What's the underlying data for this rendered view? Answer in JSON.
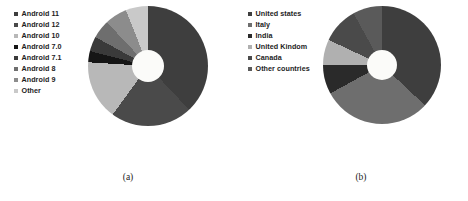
{
  "figure": {
    "panels": [
      {
        "caption": "(a)",
        "legend_position": "left",
        "chart": {
          "type": "pie",
          "subtype": "donut",
          "title": "",
          "xlabel": "",
          "ylabel": "",
          "legend_position": "left",
          "grid": false,
          "hole_ratio": 0.27,
          "start_angle_deg": 0,
          "direction": "clockwise",
          "categories": [
            "Android 11",
            "Android 12",
            "Android 10",
            "Android 7.0",
            "Android 7.1",
            "Android 8",
            "Android 9",
            "Other"
          ],
          "values": [
            38,
            22,
            16,
            3,
            4,
            5,
            6,
            6
          ],
          "colors": [
            "#3e3e3e",
            "#4a4a4a",
            "#b8b8b8",
            "#151515",
            "#3a3a3a",
            "#6e6e6e",
            "#8c8c8c",
            "#c9c9c9"
          ]
        }
      },
      {
        "caption": "(b)",
        "legend_position": "left",
        "chart": {
          "type": "pie",
          "subtype": "donut",
          "title": "",
          "xlabel": "",
          "ylabel": "",
          "legend_position": "left",
          "grid": false,
          "hole_ratio": 0.25,
          "start_angle_deg": 0,
          "direction": "clockwise",
          "categories": [
            "United states",
            "Italy",
            "India",
            "United Kindom",
            "Canada",
            "Other countries"
          ],
          "values": [
            37,
            30,
            8,
            7,
            10,
            8
          ],
          "colors": [
            "#3e3e3e",
            "#6e6e6e",
            "#2a2a2a",
            "#b0b0b0",
            "#4a4a4a",
            "#5a5a5a"
          ]
        }
      }
    ]
  },
  "chart_data": [
    {
      "type": "pie",
      "panel": "(a)",
      "title": "",
      "categories": [
        "Android 11",
        "Android 12",
        "Android 10",
        "Android 7.0",
        "Android 7.1",
        "Android 8",
        "Android 9",
        "Other"
      ],
      "values": [
        38,
        22,
        16,
        3,
        4,
        5,
        6,
        6
      ],
      "xlabel": "",
      "ylabel": "",
      "legend": [
        "Android 11",
        "Android 12",
        "Android 10",
        "Android 7.0",
        "Android 7.1",
        "Android 8",
        "Android 9",
        "Other"
      ],
      "legend_position": "left",
      "grid": false
    },
    {
      "type": "pie",
      "panel": "(b)",
      "title": "",
      "categories": [
        "United states",
        "Italy",
        "India",
        "United Kindom",
        "Canada",
        "Other countries"
      ],
      "values": [
        37,
        30,
        8,
        7,
        10,
        8
      ],
      "xlabel": "",
      "ylabel": "",
      "legend": [
        "United states",
        "Italy",
        "India",
        "United Kindom",
        "Canada",
        "Other countries"
      ],
      "legend_position": "left",
      "grid": false
    }
  ]
}
